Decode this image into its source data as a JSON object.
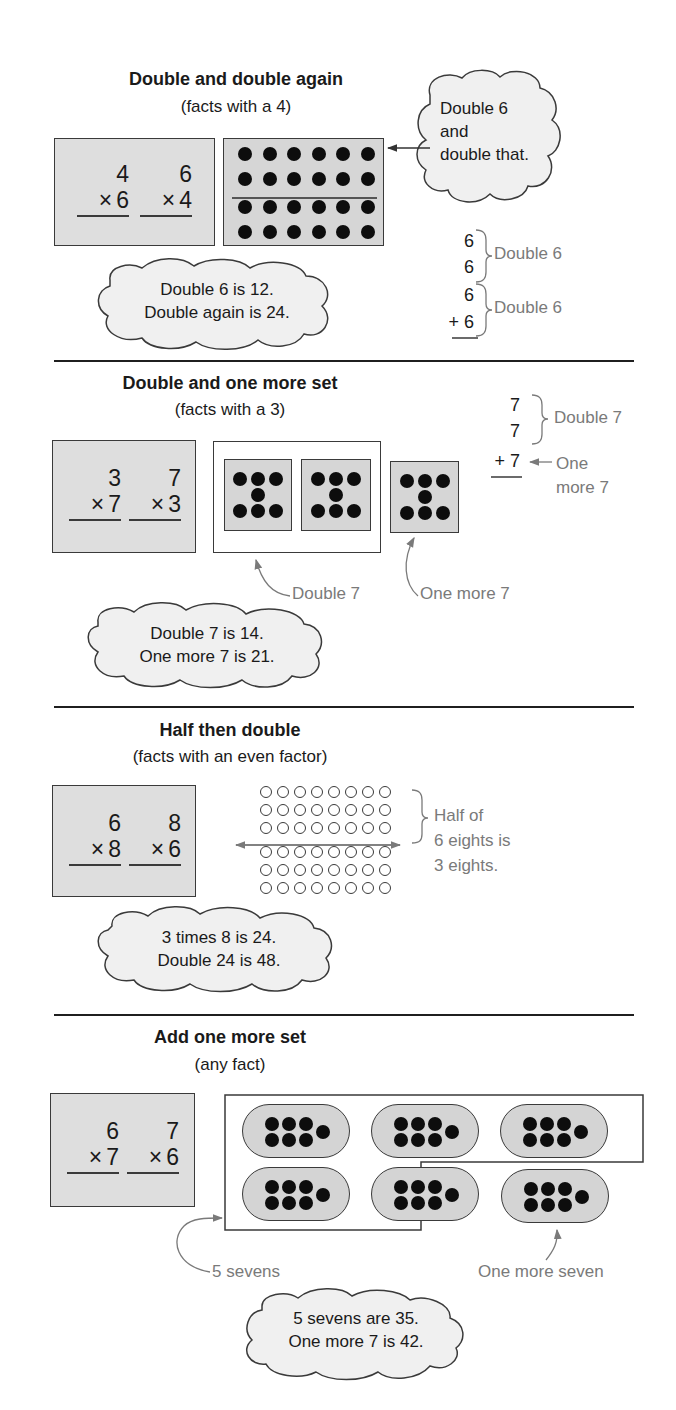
{
  "sections": [
    {
      "title": "Double and double again",
      "subtitle": "(facts with a 4)",
      "facts": [
        {
          "top": "4",
          "op": "×",
          "bottom": "6"
        },
        {
          "top": "6",
          "op": "×",
          "bottom": "4"
        }
      ],
      "array": {
        "rows": 4,
        "cols": 6,
        "divider_after_row": 2,
        "dot_style": "filled"
      },
      "hint_cloud": {
        "lines": [
          "Double 6",
          "and",
          "double that."
        ]
      },
      "sum_column": {
        "addends": [
          "6",
          "6",
          "6",
          "+ 6"
        ],
        "brace_labels": [
          "Double 6",
          "Double 6"
        ]
      },
      "result_cloud": {
        "lines": [
          "Double 6 is 12.",
          "Double again is 24."
        ]
      }
    },
    {
      "title": "Double and one more set",
      "subtitle": "(facts with a 3)",
      "facts": [
        {
          "top": "3",
          "op": "×",
          "bottom": "7"
        },
        {
          "top": "7",
          "op": "×",
          "bottom": "3"
        }
      ],
      "sets": {
        "count": 3,
        "dots_per_set": 7,
        "grouped_in_double": 2
      },
      "callouts": [
        "Double 7",
        "One more 7"
      ],
      "sum_column": {
        "addends": [
          "7",
          "7",
          "+ 7"
        ],
        "brace_label": "Double 7",
        "arrow_label": [
          "One",
          "more 7"
        ]
      },
      "result_cloud": {
        "lines": [
          "Double 7 is 14.",
          "One more 7 is 21."
        ]
      }
    },
    {
      "title": "Half then double",
      "subtitle": "(facts with an even factor)",
      "facts": [
        {
          "top": "6",
          "op": "×",
          "bottom": "8"
        },
        {
          "top": "8",
          "op": "×",
          "bottom": "6"
        }
      ],
      "array": {
        "rows": 6,
        "cols": 8,
        "divider_after_row": 3,
        "dot_style": "open"
      },
      "brace_label": [
        "Half of",
        "6 eights is",
        "3 eights."
      ],
      "result_cloud": {
        "lines": [
          "3 times 8 is 24.",
          "Double 24 is 48."
        ]
      }
    },
    {
      "title": "Add one more set",
      "subtitle": "(any fact)",
      "facts": [
        {
          "top": "6",
          "op": "×",
          "bottom": "7"
        },
        {
          "top": "7",
          "op": "×",
          "bottom": "6"
        }
      ],
      "sets": {
        "count": 6,
        "dots_per_set": 7,
        "grouped": 5
      },
      "callouts": [
        "5 sevens",
        "One more seven"
      ],
      "result_cloud": {
        "lines": [
          "5 sevens are 35.",
          "One more 7 is 42."
        ]
      }
    }
  ],
  "colors": {
    "text": "#1a1a1a",
    "annotation_gray": "#7a7a7a",
    "box_fill": "#dedede",
    "dot": "#0d0d0d",
    "rule": "#1f1f1f"
  }
}
